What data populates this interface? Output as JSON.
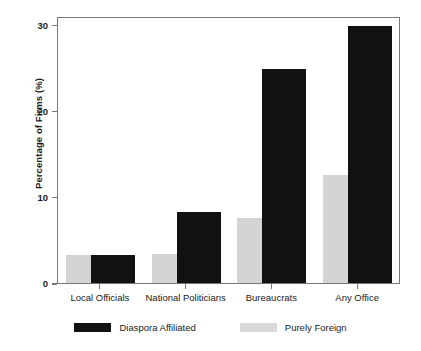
{
  "chart_data": {
    "type": "bar",
    "title": "",
    "xlabel": "",
    "ylabel": "Percentage of Firms (%)",
    "categories": [
      "Local Officials",
      "National Politicians",
      "Bureaucrats",
      "Any Office"
    ],
    "series": [
      {
        "name": "Diaspora Affiliated",
        "color": "#111111",
        "values": [
          3.3,
          8.3,
          24.8,
          29.8
        ]
      },
      {
        "name": "Purely Foreign",
        "color": "#d4d4d4",
        "values": [
          3.3,
          3.4,
          7.5,
          12.5
        ]
      }
    ],
    "ylim": [
      0,
      31
    ],
    "yticks": [
      0,
      10,
      20,
      30
    ],
    "ytick_labels": [
      "0",
      "10",
      "20",
      "30"
    ],
    "grid": false,
    "legend_position": "bottom",
    "bar_style": "overlapping"
  },
  "legend": {
    "entries": [
      {
        "label": "Diaspora Affiliated",
        "swatch": "diaspora"
      },
      {
        "label": "Purely Foreign",
        "swatch": "foreign"
      }
    ]
  }
}
